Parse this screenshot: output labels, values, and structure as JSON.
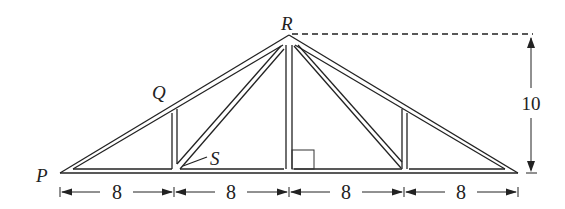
{
  "diagram": {
    "points": {
      "P": {
        "label": "P"
      },
      "Q": {
        "label": "Q"
      },
      "R": {
        "label": "R"
      },
      "S": {
        "label": "S"
      }
    },
    "dimensions": {
      "height": "10",
      "segments": [
        "8",
        "8",
        "8",
        "8"
      ]
    },
    "right_angle_marker": true,
    "line_color": "#222222"
  }
}
